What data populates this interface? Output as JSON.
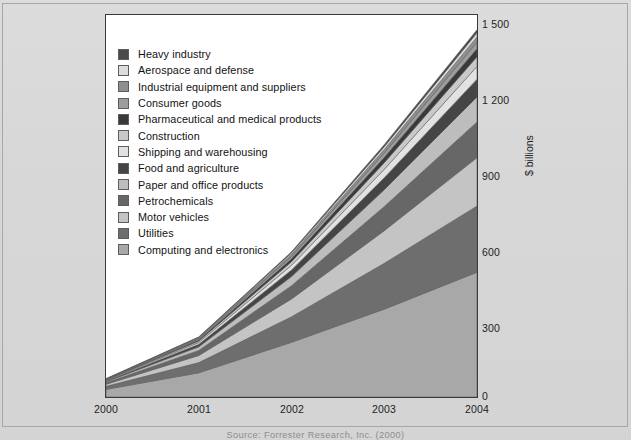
{
  "figure": {
    "source_note": "Source: Forrester Research, Inc. (2000)"
  },
  "axis": {
    "y_label": "$ billions",
    "y_ticks": [
      "0",
      "300",
      "600",
      "900",
      "1 200",
      "1 500"
    ],
    "x_ticks": [
      "2000",
      "2001",
      "2002",
      "2003",
      "2004"
    ]
  },
  "legend": {
    "items": [
      {
        "label": "Heavy industry",
        "color": "#4a4a4a"
      },
      {
        "label": "Aerospace and defense",
        "color": "#dcdcdc"
      },
      {
        "label": "Industrial equipment and suppliers",
        "color": "#8f8f8f"
      },
      {
        "label": "Consumer goods",
        "color": "#9d9d9d"
      },
      {
        "label": "Pharmaceutical and medical products",
        "color": "#3a3a3a"
      },
      {
        "label": "Construction",
        "color": "#c9c9c9"
      },
      {
        "label": "Shipping and warehousing",
        "color": "#e2e2e2"
      },
      {
        "label": "Food and agriculture",
        "color": "#454545"
      },
      {
        "label": "Paper and office products",
        "color": "#bdbdbd"
      },
      {
        "label": "Petrochemicals",
        "color": "#676767"
      },
      {
        "label": "Motor vehicles",
        "color": "#c4c4c4"
      },
      {
        "label": "Utilities",
        "color": "#6e6e6e"
      },
      {
        "label": "Computing and electronics",
        "color": "#a8a8a8"
      }
    ]
  },
  "chart_data": {
    "type": "area",
    "title": "",
    "xlabel": "",
    "ylabel": "$ billions",
    "x": [
      "2000",
      "2001",
      "2002",
      "2003",
      "2004"
    ],
    "ylim": [
      0,
      1500
    ],
    "yticks": [
      0,
      300,
      600,
      900,
      1200,
      1500
    ],
    "grid": false,
    "legend_position": "inside-top-left",
    "stacked": true,
    "series": [
      {
        "name": "Computing and electronics",
        "color": "#a8a8a8",
        "values": [
          30,
          95,
          215,
          345,
          490
        ]
      },
      {
        "name": "Utilities",
        "color": "#6e6e6e",
        "values": [
          12,
          40,
          100,
          180,
          260
        ]
      },
      {
        "name": "Motor vehicles",
        "color": "#c4c4c4",
        "values": [
          8,
          28,
          70,
          128,
          190
        ]
      },
      {
        "name": "Petrochemicals",
        "color": "#676767",
        "values": [
          6,
          20,
          52,
          95,
          140
        ]
      },
      {
        "name": "Paper and office products",
        "color": "#bdbdbd",
        "values": [
          4,
          14,
          36,
          66,
          98
        ]
      },
      {
        "name": "Food and agriculture",
        "color": "#454545",
        "values": [
          3,
          10,
          26,
          47,
          70
        ]
      },
      {
        "name": "Shipping and warehousing",
        "color": "#e2e2e2",
        "values": [
          2,
          7,
          18,
          33,
          50
        ]
      },
      {
        "name": "Construction",
        "color": "#c9c9c9",
        "values": [
          2,
          6,
          14,
          26,
          38
        ]
      },
      {
        "name": "Pharmaceutical and medical products",
        "color": "#3a3a3a",
        "values": [
          1,
          5,
          12,
          21,
          32
        ]
      },
      {
        "name": "Consumer goods",
        "color": "#9d9d9d",
        "values": [
          1,
          4,
          9,
          17,
          25
        ]
      },
      {
        "name": "Industrial equipment and suppliers",
        "color": "#8f8f8f",
        "values": [
          1,
          3,
          8,
          14,
          21
        ]
      },
      {
        "name": "Aerospace and defense",
        "color": "#dcdcdc",
        "values": [
          1,
          2,
          6,
          11,
          16
        ]
      },
      {
        "name": "Heavy industry",
        "color": "#4a4a4a",
        "values": [
          1,
          2,
          4,
          8,
          12
        ]
      }
    ],
    "totals": [
      72,
      236,
      570,
      991,
      1442
    ]
  }
}
